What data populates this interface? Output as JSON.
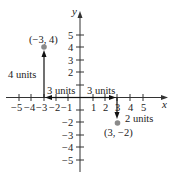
{
  "diagram": {
    "type": "coordinate-plane",
    "axes": {
      "x_label": "x",
      "y_label": "y",
      "x_ticks": [
        "−5",
        "−4",
        "−3",
        "−2",
        "−1",
        "1",
        "2",
        "3",
        "4",
        "5"
      ],
      "y_ticks": [
        "5",
        "4",
        "3",
        "2",
        "−2",
        "−3",
        "−4",
        "−5"
      ],
      "range": [
        -5,
        5
      ]
    },
    "points": [
      {
        "label": "(−3, 4)",
        "x": -3,
        "y": 4,
        "color": "#8a8a8a"
      },
      {
        "label": "(3, −2)",
        "x": 3,
        "y": -2,
        "color": "#8a8a8a"
      }
    ],
    "annotations": {
      "left_horizontal": "3 units",
      "right_horizontal": "3 units",
      "vertical_up": "4 units",
      "vertical_down": "2 units"
    }
  }
}
